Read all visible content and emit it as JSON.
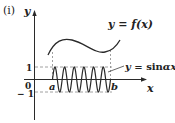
{
  "figure": {
    "panel_label": "(ⅰ)",
    "axes": {
      "x_label": "x",
      "y_label": "y",
      "origin_label": "0",
      "y_ticks": [
        {
          "value": 1,
          "label": "1"
        },
        {
          "value": -1,
          "label": "− 1"
        }
      ],
      "x_marks": [
        {
          "name": "a",
          "label": "a"
        },
        {
          "name": "b",
          "label": "b"
        }
      ]
    },
    "curves": [
      {
        "name": "f",
        "label_parts": {
          "prefix": "y = ",
          "func": "f",
          "arg": "(x)"
        }
      },
      {
        "name": "sin",
        "label_parts": {
          "prefix": "y = ",
          "func": "sin",
          "arg": "αx"
        },
        "half_periods": 12
      }
    ],
    "colors": {
      "axis": "#2a2a2a",
      "curve": "#2a2a2a",
      "dashed": "#888888",
      "text": "#222222"
    }
  }
}
